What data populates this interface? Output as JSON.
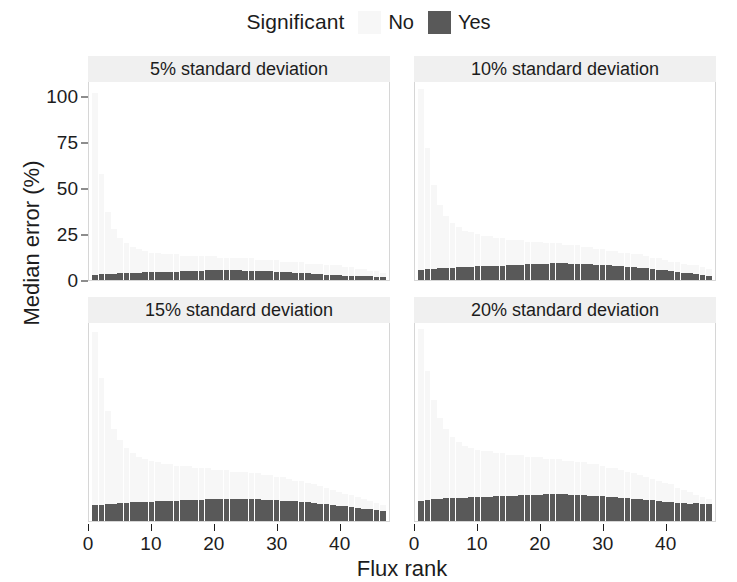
{
  "legend": {
    "title": "Significant",
    "entries": [
      {
        "label": "No",
        "color": "#f7f7f7"
      },
      {
        "label": "Yes",
        "color": "#595959"
      }
    ]
  },
  "axes": {
    "y_title": "Median error (%)",
    "x_title": "Flux rank"
  },
  "chart_data": {
    "type": "bar",
    "title": "",
    "subtitle": "",
    "xlabel": "Flux rank",
    "ylabel": "Median error (%)",
    "xlim": [
      0,
      48
    ],
    "ylim": [
      0,
      108
    ],
    "x_ticks": [
      0,
      10,
      20,
      30,
      40
    ],
    "y_ticks": [
      0,
      25,
      50,
      75,
      100
    ],
    "grid": false,
    "legend_title": "Significant",
    "legend_position": "top",
    "legend_entries": [
      "No",
      "Yes"
    ],
    "facet_layout": {
      "rows": 2,
      "cols": 2
    },
    "x": [
      1,
      2,
      3,
      4,
      5,
      6,
      7,
      8,
      9,
      10,
      11,
      12,
      13,
      14,
      15,
      16,
      17,
      18,
      19,
      20,
      21,
      22,
      23,
      24,
      25,
      26,
      27,
      28,
      29,
      30,
      31,
      32,
      33,
      34,
      35,
      36,
      37,
      38,
      39,
      40,
      41,
      42,
      43,
      44,
      45,
      46,
      47
    ],
    "panels": [
      {
        "facet": "5% standard deviation",
        "row": 0,
        "col": 0,
        "series": [
          {
            "name": "No",
            "color": "#f7f7f7",
            "values": [
              102,
              58,
              37,
              28,
              23,
              20,
              18,
              17,
              16,
              15,
              15,
              14,
              14,
              14,
              13,
              13,
              13,
              13,
              13,
              13,
              12,
              12,
              12,
              12,
              12,
              12,
              11,
              11,
              11,
              11,
              10,
              10,
              10,
              10,
              9,
              9,
              9,
              8,
              8,
              8,
              7,
              7,
              6,
              6,
              5,
              5,
              4
            ]
          },
          {
            "name": "Yes",
            "color": "#595959",
            "values": [
              3.0,
              3.2,
              3.3,
              3.5,
              3.6,
              3.8,
              3.9,
              4.0,
              4.2,
              4.3,
              4.4,
              4.4,
              4.5,
              4.6,
              4.8,
              4.9,
              5.0,
              5.1,
              5.2,
              5.2,
              5.3,
              5.3,
              5.2,
              5.2,
              5.1,
              5.0,
              4.9,
              4.8,
              4.7,
              4.6,
              4.4,
              4.2,
              4.0,
              3.8,
              3.6,
              3.4,
              3.2,
              3.0,
              2.8,
              2.6,
              2.4,
              2.3,
              2.2,
              2.1,
              2.0,
              1.9,
              1.8
            ]
          }
        ]
      },
      {
        "facet": "10% standard deviation",
        "row": 0,
        "col": 1,
        "series": [
          {
            "name": "No",
            "color": "#f7f7f7",
            "values": [
              104,
              72,
              52,
              41,
              35,
              31,
              29,
              27,
              26,
              25,
              24,
              24,
              23,
              23,
              22,
              22,
              22,
              21,
              21,
              21,
              20,
              20,
              20,
              19,
              19,
              19,
              18,
              18,
              17,
              17,
              16,
              16,
              15,
              15,
              14,
              14,
              13,
              12,
              12,
              11,
              10,
              10,
              9,
              8,
              8,
              7,
              6
            ]
          },
          {
            "name": "Yes",
            "color": "#595959",
            "values": [
              5.5,
              6.0,
              6.2,
              6.4,
              6.6,
              6.8,
              7.0,
              7.1,
              7.3,
              7.4,
              7.5,
              7.6,
              7.8,
              7.9,
              8.0,
              8.2,
              8.4,
              8.6,
              8.8,
              8.9,
              9.0,
              9.1,
              9.2,
              9.1,
              9.0,
              8.9,
              8.8,
              8.6,
              8.4,
              8.2,
              8.0,
              7.8,
              7.5,
              7.2,
              6.9,
              6.6,
              6.3,
              6.0,
              5.6,
              5.2,
              4.8,
              4.4,
              4.0,
              3.6,
              3.2,
              2.8,
              2.4
            ]
          }
        ]
      },
      {
        "facet": "15% standard deviation",
        "row": 1,
        "col": 0,
        "series": [
          {
            "name": "No",
            "color": "#f7f7f7",
            "values": [
              103,
              78,
              60,
              50,
              44,
              40,
              37,
              35,
              34,
              33,
              32,
              31,
              31,
              30,
              30,
              30,
              29,
              29,
              29,
              28,
              28,
              28,
              27,
              27,
              27,
              26,
              26,
              25,
              25,
              24,
              24,
              23,
              22,
              22,
              21,
              20,
              19,
              18,
              17,
              16,
              15,
              14,
              13,
              12,
              11,
              10,
              9
            ]
          },
          {
            "name": "Yes",
            "color": "#595959",
            "values": [
              8.5,
              9.0,
              9.3,
              9.5,
              9.7,
              9.9,
              10.1,
              10.2,
              10.4,
              10.5,
              10.7,
              10.8,
              11.0,
              11.1,
              11.3,
              11.4,
              11.6,
              11.7,
              11.8,
              11.9,
              12.0,
              12.1,
              12.1,
              12.0,
              11.9,
              11.9,
              11.8,
              11.7,
              11.5,
              11.3,
              11.1,
              10.9,
              10.7,
              10.4,
              10.1,
              9.8,
              9.5,
              9.2,
              8.8,
              8.4,
              8.0,
              7.6,
              7.2,
              6.8,
              6.4,
              6.0,
              5.6
            ]
          }
        ]
      },
      {
        "facet": "20% standard deviation",
        "row": 1,
        "col": 1,
        "series": [
          {
            "name": "No",
            "color": "#f7f7f7",
            "values": [
              105,
              82,
              66,
              56,
              50,
              46,
              43,
              41,
              40,
              39,
              38,
              38,
              37,
              37,
              36,
              36,
              36,
              35,
              35,
              35,
              34,
              34,
              34,
              33,
              33,
              32,
              32,
              31,
              31,
              30,
              29,
              29,
              28,
              27,
              26,
              25,
              24,
              23,
              22,
              21,
              20,
              18,
              17,
              16,
              14,
              13,
              12
            ]
          },
          {
            "name": "Yes",
            "color": "#595959",
            "values": [
              11.0,
              11.6,
              11.9,
              12.1,
              12.3,
              12.5,
              12.6,
              12.8,
              12.9,
              13.0,
              13.2,
              13.3,
              13.4,
              13.6,
              13.7,
              13.9,
              14.0,
              14.2,
              14.3,
              14.4,
              14.5,
              14.6,
              14.6,
              14.5,
              14.4,
              14.3,
              14.1,
              13.9,
              13.7,
              13.5,
              13.3,
              13.0,
              12.7,
              12.4,
              12.1,
              11.8,
              11.5,
              11.2,
              10.9,
              10.6,
              10.3,
              10.0,
              9.6,
              9.2,
              9.6,
              9.3,
              9.5
            ]
          }
        ]
      }
    ]
  }
}
